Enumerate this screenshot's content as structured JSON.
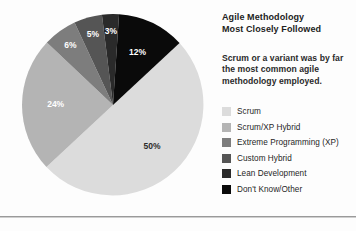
{
  "chart_data": {
    "type": "pie",
    "title": "Agile Methodology\nMost Closely Followed",
    "caption": "Scrum or a variant was by far the most common agile methodology employed.",
    "categories": [
      "Scrum",
      "Scrum/XP Hybrid",
      "Extreme Programming (XP)",
      "Custom Hybrid",
      "Lean Development",
      "Don't Know/Other"
    ],
    "values": [
      50,
      24,
      6,
      5,
      3,
      12
    ],
    "data_labels": [
      "50%",
      "24%",
      "6%",
      "5%",
      "3%",
      "12%"
    ],
    "colors": [
      "#dcdcdc",
      "#b4b4b4",
      "#7d7d7d",
      "#555555",
      "#2a2a2a",
      "#0a0a0a"
    ],
    "label_colors": [
      "#2b2b2b",
      "#ffffff",
      "#ffffff",
      "#ffffff",
      "#ffffff",
      "#ffffff"
    ],
    "legend_position": "right",
    "start_angle_deg": 47,
    "grid": false,
    "xlabel": "",
    "ylabel": ""
  },
  "legend": {
    "items": [
      {
        "label": "Scrum",
        "color": "#dcdcdc",
        "value": "50%"
      },
      {
        "label": "Scrum/XP Hybrid",
        "color": "#b4b4b4",
        "value": "24%"
      },
      {
        "label": "Extreme Programming (XP)",
        "color": "#7d7d7d",
        "value": "6%"
      },
      {
        "label": "Custom Hybrid",
        "color": "#555555",
        "value": "5%"
      },
      {
        "label": "Lean Development",
        "color": "#2a2a2a",
        "value": "3%"
      },
      {
        "label": "Don't Know/Other",
        "color": "#0a0a0a",
        "value": "12%"
      }
    ]
  }
}
